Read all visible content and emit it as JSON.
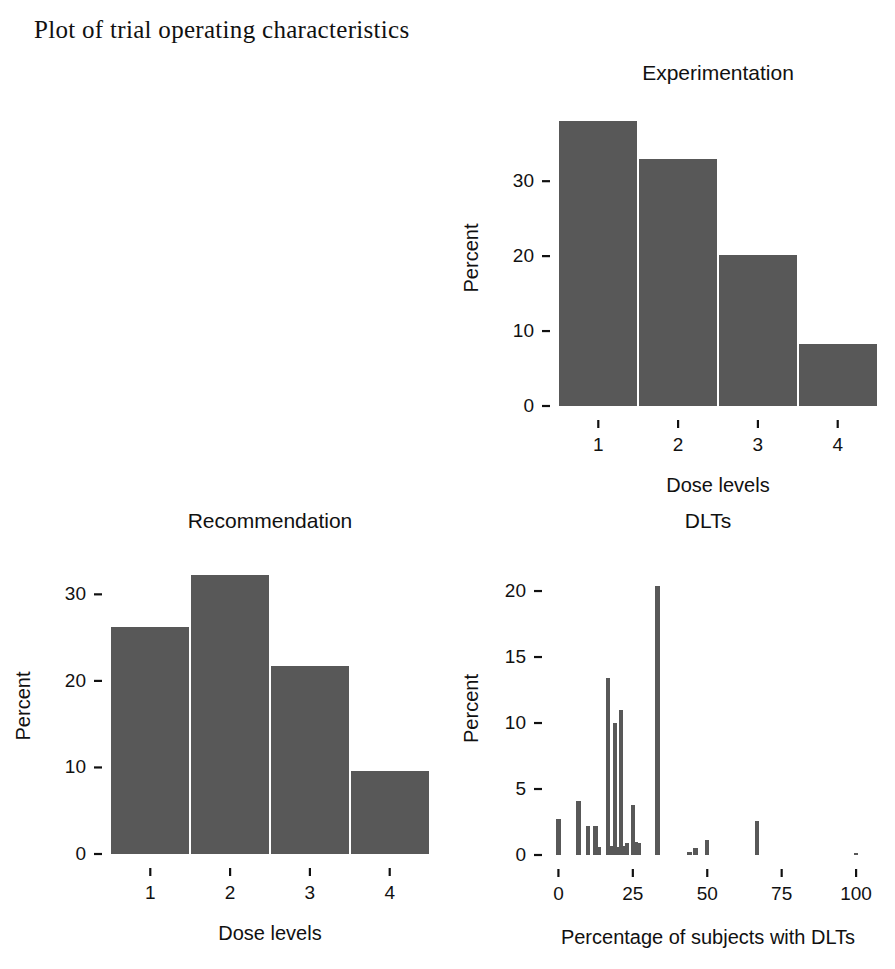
{
  "figure": {
    "title": "Plot of trial operating characteristics",
    "background": "#ffffff",
    "bar_color": "#585858",
    "text_color": "#111111"
  },
  "panels": {
    "sample_size": {
      "title": "Sample size",
      "xlabel": "Sample size",
      "ylabel": "Percent"
    },
    "experimentation": {
      "title": "Experimentation",
      "xlabel": "Dose levels",
      "ylabel": "Percent"
    },
    "recommendation": {
      "title": "Recommendation",
      "xlabel": "Dose levels",
      "ylabel": "Percent"
    },
    "dlts": {
      "title": "DLTs",
      "xlabel": "Percentage of subjects with DLTs",
      "ylabel": "Percent"
    }
  },
  "chart_data": [
    {
      "id": "sample_size",
      "type": "bar",
      "title": "Sample size",
      "xlabel": "Sample size",
      "ylabel": "Percent",
      "x": [
        3,
        6,
        9,
        12,
        15,
        18,
        21,
        24
      ],
      "values": [
        2.7,
        14.2,
        24.0,
        26.8,
        20.6,
        9.6,
        2.3,
        0.3
      ],
      "bar_width": 1.3,
      "xlim": [
        1.5,
        25.8
      ],
      "ylim": [
        0,
        28.5
      ],
      "xticks": [
        5,
        10,
        15,
        20,
        25
      ],
      "xticklabels": [
        "5",
        "10",
        "15",
        "20",
        "25"
      ],
      "yticks": [
        0,
        10,
        20
      ],
      "yticklabels": [
        "0",
        "10",
        "20"
      ],
      "grid": false,
      "legend": "none"
    },
    {
      "id": "experimentation",
      "type": "bar",
      "title": "Experimentation",
      "xlabel": "Dose levels",
      "ylabel": "Percent",
      "categories": [
        "1",
        "2",
        "3",
        "4"
      ],
      "x": [
        1,
        2,
        3,
        4
      ],
      "values": [
        38.0,
        33.0,
        20.2,
        8.3
      ],
      "bar_width": 0.98,
      "xlim": [
        0.47,
        4.53
      ],
      "ylim": [
        0,
        39.5
      ],
      "xticks": [
        1,
        2,
        3,
        4
      ],
      "xticklabels": [
        "1",
        "2",
        "3",
        "4"
      ],
      "yticks": [
        0,
        10,
        20,
        30
      ],
      "yticklabels": [
        "0",
        "10",
        "20",
        "30"
      ],
      "grid": false,
      "legend": "none"
    },
    {
      "id": "recommendation",
      "type": "bar",
      "title": "Recommendation",
      "xlabel": "Dose levels",
      "ylabel": "Percent",
      "categories": [
        "1",
        "2",
        "3",
        "4"
      ],
      "x": [
        1,
        2,
        3,
        4
      ],
      "values": [
        26.2,
        32.2,
        21.7,
        9.6
      ],
      "bar_width": 0.98,
      "xlim": [
        0.47,
        4.53
      ],
      "ylim": [
        0,
        34.2
      ],
      "xticks": [
        1,
        2,
        3,
        4
      ],
      "xticklabels": [
        "1",
        "2",
        "3",
        "4"
      ],
      "yticks": [
        0,
        10,
        20,
        30
      ],
      "yticklabels": [
        "0",
        "10",
        "20",
        "30"
      ],
      "grid": false,
      "legend": "none"
    },
    {
      "id": "dlts",
      "type": "bar",
      "title": "DLTs",
      "xlabel": "Percentage of subjects with DLTs",
      "ylabel": "Percent",
      "x": [
        0,
        6.7,
        10,
        12.5,
        13.5,
        16.7,
        18,
        19,
        20,
        21,
        22,
        23,
        25,
        26,
        27,
        33.3,
        44,
        46,
        50,
        66.7,
        100
      ],
      "values": [
        2.7,
        4.1,
        2.2,
        2.2,
        0.6,
        13.4,
        0.7,
        10.0,
        0.6,
        11.0,
        0.7,
        0.9,
        3.8,
        1.0,
        0.9,
        20.4,
        0.2,
        0.5,
        1.1,
        2.6,
        0.1
      ],
      "bar_width": 1.5,
      "xlim": [
        -3.5,
        104
      ],
      "ylim": [
        0,
        22.2
      ],
      "xticks": [
        0,
        25,
        50,
        75,
        100
      ],
      "xticklabels": [
        "0",
        "25",
        "50",
        "75",
        "100"
      ],
      "yticks": [
        0,
        5,
        10,
        15,
        20
      ],
      "yticklabels": [
        "0",
        "5",
        "10",
        "15",
        "20"
      ],
      "grid": false,
      "legend": "none"
    }
  ]
}
